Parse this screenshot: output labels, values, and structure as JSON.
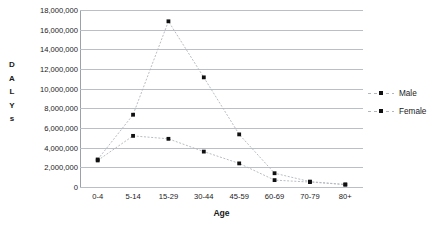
{
  "chart_data": {
    "type": "line",
    "title": "",
    "xlabel": "Age",
    "ylabel": "DALYs",
    "ylabel_letters": [
      "D",
      "A",
      "L",
      "Y",
      "s"
    ],
    "categories": [
      "0-4",
      "5-14",
      "15-29",
      "30-44",
      "45-59",
      "60-69",
      "70-79",
      "80+"
    ],
    "series": [
      {
        "name": "Male",
        "values": [
          2700000,
          5200000,
          4900000,
          3600000,
          2400000,
          700000,
          500000,
          250000
        ]
      },
      {
        "name": "Female",
        "values": [
          2800000,
          7350000,
          16850000,
          11150000,
          5350000,
          1400000,
          550000,
          250000
        ]
      }
    ],
    "ylim": [
      0,
      18000000
    ],
    "ytick_values": [
      0,
      2000000,
      4000000,
      6000000,
      8000000,
      10000000,
      12000000,
      14000000,
      16000000,
      18000000
    ],
    "ytick_labels": [
      "0",
      "2,000,000",
      "4,000,000",
      "6,000,000",
      "8,000,000",
      "10,000,000",
      "12,000,000",
      "14,000,000",
      "16,000,000",
      "18,000,000"
    ],
    "grid": true,
    "legend_position": "right",
    "marker": "square",
    "line_style": "dotted",
    "colors": {
      "marker": "#101010",
      "line": "#b0b6bc",
      "gridline": "#b9bfc6",
      "axis": "#9aa1a8",
      "text": "#1a1a1a",
      "background": "#ffffff"
    }
  },
  "legend": {
    "items": [
      {
        "label": "Male"
      },
      {
        "label": "Female"
      }
    ]
  }
}
